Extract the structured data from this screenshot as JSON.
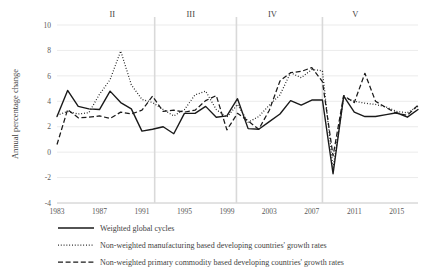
{
  "chart_data": {
    "type": "line",
    "title": "",
    "xlabel": "",
    "ylabel": "Annual percentage change",
    "ylim": [
      -4,
      10
    ],
    "ytick_step": 2,
    "yticks": [
      -4,
      -2,
      0,
      2,
      4,
      6,
      8,
      10
    ],
    "xlim": [
      1983,
      2017
    ],
    "xticks": [
      1983,
      1987,
      1991,
      1995,
      1999,
      2003,
      2007,
      2011,
      2015
    ],
    "grid": "horizontal",
    "legend_position": "bottom",
    "x": [
      1983,
      1984,
      1985,
      1986,
      1987,
      1988,
      1989,
      1990,
      1991,
      1992,
      1993,
      1994,
      1995,
      1996,
      1997,
      1998,
      1999,
      2000,
      2001,
      2002,
      2003,
      2004,
      2005,
      2006,
      2007,
      2008,
      2009,
      2010,
      2011,
      2012,
      2013,
      2014,
      2015,
      2016,
      2017
    ],
    "series": [
      {
        "name": "Weighted global cycles",
        "style": "solid",
        "color": "#1a1a1a",
        "values": [
          2.8,
          4.85,
          3.6,
          3.4,
          3.35,
          4.8,
          3.9,
          3.4,
          1.65,
          1.8,
          2.0,
          1.45,
          3.05,
          3.05,
          3.6,
          2.75,
          2.85,
          4.2,
          1.85,
          1.8,
          2.4,
          3.0,
          4.05,
          3.7,
          4.1,
          4.1,
          -1.7,
          4.4,
          3.15,
          2.8,
          2.8,
          2.95,
          3.1,
          2.75,
          3.35
        ]
      },
      {
        "name": "Non-weighted manufacturing based developing countries' growth rates",
        "style": "dotted",
        "color": "#1a1a1a",
        "values": [
          2.9,
          3.2,
          3.0,
          3.1,
          4.55,
          5.7,
          7.95,
          5.3,
          4.15,
          3.9,
          3.35,
          2.85,
          3.35,
          4.5,
          4.8,
          3.35,
          2.75,
          3.75,
          2.35,
          2.8,
          3.7,
          4.5,
          6.25,
          5.85,
          6.5,
          6.4,
          -1.25,
          4.3,
          4.0,
          3.85,
          3.75,
          3.55,
          3.2,
          3.1,
          3.6
        ]
      },
      {
        "name": "Non-weighted primary commodity based developing countries' growth rates",
        "style": "dashed",
        "color": "#1a1a1a",
        "values": [
          0.6,
          3.35,
          2.7,
          2.75,
          2.85,
          2.65,
          3.15,
          3.0,
          3.3,
          4.4,
          3.2,
          3.3,
          3.15,
          3.3,
          4.05,
          4.45,
          1.75,
          3.05,
          2.45,
          1.8,
          3.3,
          5.6,
          6.25,
          6.35,
          6.65,
          5.55,
          -0.3,
          4.45,
          3.9,
          6.2,
          4.0,
          3.5,
          3.05,
          2.9,
          3.7
        ]
      }
    ],
    "phases": [
      {
        "label": "II",
        "x_center": 1988.2
      },
      {
        "label": "III",
        "x_center": 1995.6
      },
      {
        "label": "IV",
        "x_center": 2003.3
      },
      {
        "label": "V",
        "x_center": 2011.1
      }
    ],
    "phase_dividers": [
      1992.2,
      1999.9,
      2008.0
    ]
  },
  "legend": {
    "items": [
      {
        "label": "Weighted global cycles",
        "style": "solid"
      },
      {
        "label": "Non-weighted manufacturing based developing countries' growth rates",
        "style": "dotted"
      },
      {
        "label": "Non-weighted primary commodity based developing countries' growth rates",
        "style": "dashed"
      }
    ]
  },
  "colors": {
    "line": "#1a1a1a",
    "grid": "#e6e6e6",
    "divider": "#d9d9d9",
    "text": "#3f3f3f",
    "tick_text": "#595959",
    "background": "#ffffff"
  }
}
